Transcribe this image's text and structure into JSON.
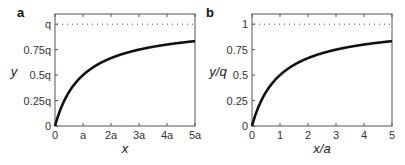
{
  "chart_data": [
    {
      "type": "line",
      "panel_label": "a",
      "xlabel": "x",
      "ylabel": "y",
      "x_ticks": [
        "0",
        "a",
        "2a",
        "3a",
        "4a",
        "5a"
      ],
      "y_ticks": [
        "0",
        "0.25q",
        "0.5q",
        "0.75q",
        "q"
      ],
      "xlim": [
        0,
        5
      ],
      "ylim": [
        0,
        1.1
      ],
      "grid": false,
      "series": [
        {
          "name": "y = q·x/(x+a)",
          "style": "solid-thick",
          "x": [
            0,
            0.25,
            0.5,
            1,
            1.5,
            2,
            2.5,
            3,
            3.5,
            4,
            4.5,
            5
          ],
          "values": [
            0,
            0.2,
            0.333,
            0.5,
            0.6,
            0.667,
            0.714,
            0.75,
            0.778,
            0.8,
            0.818,
            0.833
          ]
        },
        {
          "name": "asymptote q",
          "style": "dotted",
          "x": [
            0,
            5
          ],
          "values": [
            1,
            1
          ]
        }
      ]
    },
    {
      "type": "line",
      "panel_label": "b",
      "xlabel": "x/a",
      "ylabel": "y/q",
      "x_ticks": [
        "0",
        "1",
        "2",
        "3",
        "4",
        "5"
      ],
      "y_ticks": [
        "0",
        "0.25",
        "0.5",
        "0.75",
        "1"
      ],
      "xlim": [
        0,
        5
      ],
      "ylim": [
        0,
        1.1
      ],
      "grid": false,
      "series": [
        {
          "name": "y/q = (x/a)/(1+x/a)",
          "style": "solid-thick",
          "x": [
            0,
            0.25,
            0.5,
            1,
            1.5,
            2,
            2.5,
            3,
            3.5,
            4,
            4.5,
            5
          ],
          "values": [
            0,
            0.2,
            0.333,
            0.5,
            0.6,
            0.667,
            0.714,
            0.75,
            0.778,
            0.8,
            0.818,
            0.833
          ]
        },
        {
          "name": "asymptote 1",
          "style": "dotted",
          "x": [
            0,
            5
          ],
          "values": [
            1,
            1
          ]
        }
      ]
    }
  ]
}
